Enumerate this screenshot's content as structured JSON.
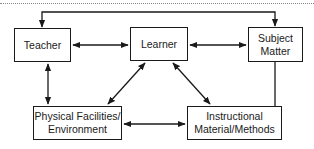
{
  "diagram": {
    "type": "concept-relationship-diagram",
    "nodes": [
      {
        "id": "teacher",
        "label": "Teacher"
      },
      {
        "id": "learner",
        "label": "Learner"
      },
      {
        "id": "subject",
        "label": "Subject\nMatter"
      },
      {
        "id": "physical",
        "label": "Physical Facilities/\nEnvironment"
      },
      {
        "id": "instruct",
        "label": "Instructional\nMaterial/Methods"
      }
    ],
    "edges": [
      {
        "from": "teacher",
        "to": "learner",
        "direction": "both"
      },
      {
        "from": "learner",
        "to": "subject",
        "direction": "both"
      },
      {
        "from": "teacher",
        "to": "physical",
        "direction": "both"
      },
      {
        "from": "learner",
        "to": "physical",
        "direction": "both"
      },
      {
        "from": "learner",
        "to": "instruct",
        "direction": "both"
      },
      {
        "from": "physical",
        "to": "instruct",
        "direction": "both"
      },
      {
        "from": "instruct",
        "to": "subject",
        "direction": "none",
        "route": "vertical line from Instructional Material up to Subject Matter"
      },
      {
        "from": "subject",
        "to": "teacher",
        "direction": "forward",
        "route": "over the top: line from Subject Matter top up, across, down into Teacher with arrowhead; arrowhead also into Subject Matter top"
      }
    ],
    "colors": {
      "stroke": "#1a1a1a",
      "background": "#ffffff",
      "rule": "#888888"
    }
  }
}
